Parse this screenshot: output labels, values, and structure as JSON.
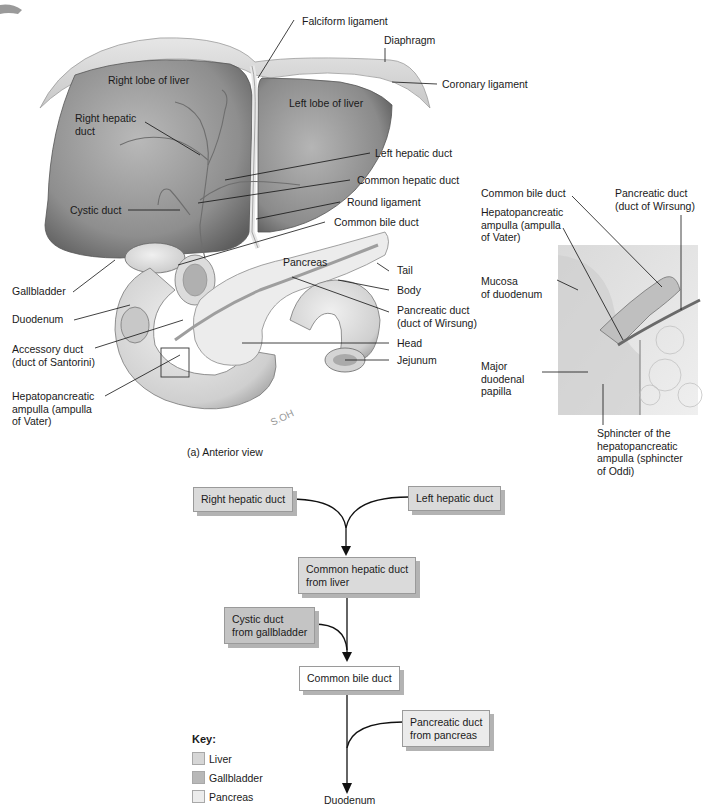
{
  "figure": {
    "panel_a_caption": "(a) Anterior view",
    "anterior_labels": {
      "falciform_ligament": "Falciform ligament",
      "diaphragm": "Diaphragm",
      "coronary_ligament": "Coronary ligament",
      "right_lobe_of_liver": "Right lobe of liver",
      "left_lobe_of_liver": "Left lobe of liver",
      "right_hepatic_duct": "Right hepatic\nduct",
      "left_hepatic_duct": "Left hepatic duct",
      "common_hepatic_duct": "Common hepatic duct",
      "cystic_duct": "Cystic duct",
      "round_ligament": "Round ligament",
      "common_bile_duct": "Common bile duct",
      "gallbladder": "Gallbladder",
      "pancreas": "Pancreas",
      "tail": "Tail",
      "body": "Body",
      "pancreatic_duct": "Pancreatic duct\n(duct of Wirsung)",
      "duodenum": "Duodenum",
      "accessory_duct": "Accessory duct\n(duct of Santorini)",
      "head": "Head",
      "jejunum": "Jejunum",
      "hepatopancreatic_ampulla": "Hepatopancreatic\nampulla (ampulla\nof Vater)",
      "artist_signature": "S.OH"
    },
    "inset_labels": {
      "common_bile_duct": "Common bile duct",
      "pancreatic_duct": "Pancreatic duct\n(duct of Wirsung)",
      "hepatopancreatic_ampulla": "Hepatopancreatic\nampulla (ampulla\nof Vater)",
      "mucosa_of_duodenum": "Mucosa\nof duodenum",
      "major_duodenal_papilla": "Major\nduodenal\npapilla",
      "sphincter": "Sphincter of the\nhepatopancreatic\nampulla (sphincter\nof Oddi)"
    }
  },
  "flowchart": {
    "nodes": [
      {
        "id": "right_hepatic",
        "label": "Right hepatic duct",
        "category": "liver"
      },
      {
        "id": "left_hepatic",
        "label": "Left hepatic duct",
        "category": "liver"
      },
      {
        "id": "common_hepatic",
        "label": "Common hepatic duct\nfrom liver",
        "category": "liver"
      },
      {
        "id": "cystic",
        "label": "Cystic duct\nfrom gallbladder",
        "category": "gallbladder"
      },
      {
        "id": "common_bile",
        "label": "Common bile duct",
        "category": "none"
      },
      {
        "id": "pancreatic",
        "label": "Pancreatic duct\nfrom pancreas",
        "category": "pancreas"
      },
      {
        "id": "duodenum",
        "label": "Duodenum",
        "category": "terminal"
      }
    ],
    "edges": [
      [
        "right_hepatic",
        "common_hepatic"
      ],
      [
        "left_hepatic",
        "common_hepatic"
      ],
      [
        "common_hepatic",
        "common_bile"
      ],
      [
        "cystic",
        "common_bile"
      ],
      [
        "common_bile",
        "duodenum"
      ],
      [
        "pancreatic",
        "duodenum"
      ]
    ]
  },
  "key": {
    "title": "Key:",
    "items": [
      {
        "label": "Liver",
        "color": "#d6d6d6"
      },
      {
        "label": "Gallbladder",
        "color": "#b8b8b8"
      },
      {
        "label": "Pancreas",
        "color": "#ececec"
      }
    ]
  }
}
